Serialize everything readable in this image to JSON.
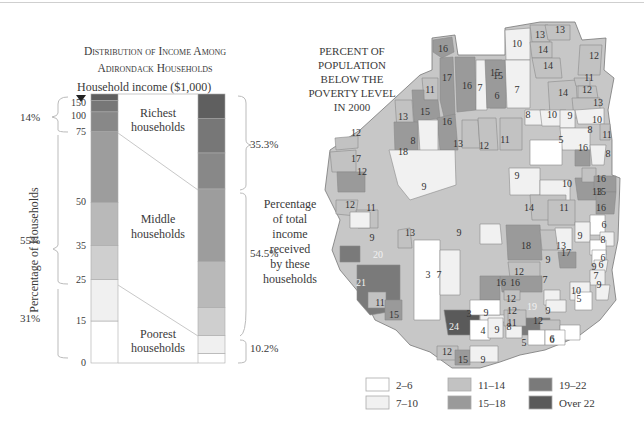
{
  "chart_data": [
    {
      "type": "bar",
      "title": "Distribution of Income Among Adirondack Households",
      "title_lines": [
        "Distribution of Income Among",
        "Adirondack Households"
      ],
      "xlabel": "",
      "ylabel": "Percentage of Households",
      "income_axis_label": "Household income ($1,000)",
      "left_bar": {
        "description": "Cumulative percentage of households by household income threshold",
        "tick_labels": [
          "0",
          "15",
          "25",
          "35",
          "50",
          "75",
          "100",
          "150"
        ],
        "segments": [
          {
            "income_range": "0-15",
            "share": 15.6,
            "color": "#ffffff"
          },
          {
            "income_range": "15-25",
            "share": 15.4,
            "color": "#f0f0f0"
          },
          {
            "income_range": "25-35",
            "share": 12.6,
            "color": "#cfcfcf"
          },
          {
            "income_range": "35-50",
            "share": 16.1,
            "color": "#b9b9b9"
          },
          {
            "income_range": "50-75",
            "share": 26.3,
            "color": "#9d9d9d"
          },
          {
            "income_range": "75-100",
            "share": 7.4,
            "color": "#888888"
          },
          {
            "income_range": "100-150",
            "share": 4.2,
            "color": "#777777"
          },
          {
            "income_range": "150+",
            "share": 2.4,
            "color": "#5f5f5f"
          }
        ]
      },
      "right_bar": {
        "description": "Percentage of total income received",
        "segments": [
          {
            "income_range": "0-15",
            "share": 3.6,
            "color": "#ffffff"
          },
          {
            "income_range": "15-25",
            "share": 6.6,
            "color": "#f0f0f0"
          },
          {
            "income_range": "25-35",
            "share": 10.5,
            "color": "#cfcfcf"
          },
          {
            "income_range": "35-50",
            "share": 17.1,
            "color": "#b9b9b9"
          },
          {
            "income_range": "50-75",
            "share": 26.9,
            "color": "#9d9d9d"
          },
          {
            "income_range": "75-100",
            "share": 13.4,
            "color": "#888888"
          },
          {
            "income_range": "100-150",
            "share": 12.7,
            "color": "#777777"
          },
          {
            "income_range": "150+",
            "share": 9.2,
            "color": "#5f5f5f"
          }
        ]
      },
      "groups": [
        {
          "name": "Richest households",
          "lines": [
            "Richest",
            "households"
          ],
          "households_pct": "14%",
          "income_pct": "35.3%"
        },
        {
          "name": "Middle households",
          "lines": [
            "Middle",
            "households"
          ],
          "households_pct": "55%",
          "income_pct": "54.5%"
        },
        {
          "name": "Poorest households",
          "lines": [
            "Poorest",
            "households"
          ],
          "households_pct": "31%",
          "income_pct": "10.2%"
        }
      ],
      "right_annotation_lines": [
        "Percentage",
        "of total",
        "income",
        "received",
        "by these",
        "households"
      ]
    },
    {
      "type": "heatmap",
      "subtype": "choropleth map",
      "title": "Percent of Population Below the Poverty Level in 2000",
      "title_lines": [
        "PERCENT OF",
        "POPULATION",
        "BELOW THE",
        "POVERTY LEVEL",
        "IN 2000"
      ],
      "legend": [
        {
          "label": "2–6",
          "color": "#ffffff"
        },
        {
          "label": "7–10",
          "color": "#f1f1f1"
        },
        {
          "label": "11–14",
          "color": "#c2c2c2"
        },
        {
          "label": "15–18",
          "color": "#9a9a9a"
        },
        {
          "label": "19–22",
          "color": "#7a7a7a"
        },
        {
          "label": "Over 22",
          "color": "#5a5a5a"
        }
      ],
      "legend_position": "bottom",
      "region_values": [
        16,
        17,
        16,
        11,
        15,
        13,
        15,
        7,
        6,
        10,
        13,
        14,
        14,
        12,
        13,
        7,
        15,
        16,
        14,
        11,
        12,
        13,
        12,
        12,
        17,
        18,
        8,
        13,
        12,
        11,
        8,
        10,
        9,
        10,
        8,
        11,
        5,
        16,
        8,
        9,
        16,
        9,
        10,
        13,
        15,
        16,
        14,
        11,
        12,
        11,
        9,
        6,
        9,
        8,
        6,
        20,
        13,
        9,
        18,
        13,
        9,
        6,
        17,
        9,
        21,
        3,
        7,
        12,
        16,
        7,
        9,
        11,
        7,
        12,
        16,
        10,
        5,
        15,
        24,
        9,
        3,
        4,
        9,
        12,
        19,
        9,
        8,
        11,
        12,
        6,
        12,
        15,
        9,
        5,
        6
      ]
    }
  ],
  "labels": {
    "title_line1": "Distribution of Income Among",
    "title_line2": "Adirondack Households",
    "income_axis": "Household income ($1,000)",
    "y_axis": "Percentage of Households",
    "pct_rich": "14%",
    "pct_middle": "55%",
    "pct_poor": "31%",
    "inc_rich": "35.3%",
    "inc_middle": "54.5%",
    "inc_poor": "10.2%",
    "rich_1": "Richest",
    "rich_2": "households",
    "mid_1": "Middle",
    "mid_2": "households",
    "poor_1": "Poorest",
    "poor_2": "households",
    "ann": [
      "Percentage",
      "of total",
      "income",
      "received",
      "by these",
      "households"
    ],
    "ticks": [
      "150",
      "100",
      "75",
      "50",
      "35",
      "25",
      "15",
      "0"
    ],
    "map_title": [
      "PERCENT OF",
      "POPULATION",
      "BELOW THE",
      "POVERTY LEVEL",
      "IN 2000"
    ],
    "legend": [
      "2–6",
      "7–10",
      "11–14",
      "15–18",
      "19–22",
      "Over 22"
    ]
  }
}
